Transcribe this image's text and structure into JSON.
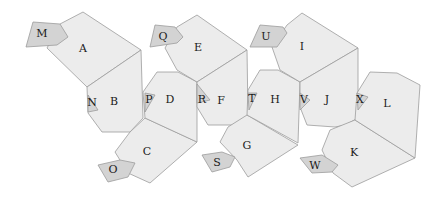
{
  "diagram": {
    "title": "",
    "colors": {
      "face": "#ececec",
      "flap": "#d3d3d3",
      "stroke": "#9c9c9c",
      "label": "#1a1a1a"
    },
    "faces": [
      {
        "label": "A",
        "type": "face",
        "pos": [
          83,
          49
        ],
        "points": [
          [
            60,
            24
          ],
          [
            83,
            12
          ],
          [
            141,
            50
          ],
          [
            87,
            87
          ],
          [
            47,
            48
          ]
        ]
      },
      {
        "label": "M",
        "type": "flap",
        "pos": [
          42,
          34
        ],
        "points": [
          [
            33,
            22
          ],
          [
            60,
            24
          ],
          [
            68,
            37
          ],
          [
            57,
            45
          ],
          [
            26,
            47
          ]
        ]
      },
      {
        "label": "B",
        "type": "face",
        "pos": [
          114,
          102
        ],
        "points": [
          [
            87,
            87
          ],
          [
            141,
            50
          ],
          [
            143,
            118
          ],
          [
            130,
            132
          ],
          [
            102,
            132
          ],
          [
            88,
            113
          ]
        ]
      },
      {
        "label": "N",
        "type": "flap",
        "pos": [
          92,
          103
        ],
        "points": [
          [
            88,
            95
          ],
          [
            98,
            110
          ],
          [
            88,
            112
          ]
        ]
      },
      {
        "label": "C",
        "type": "face",
        "pos": [
          147,
          152
        ],
        "points": [
          [
            145,
            118
          ],
          [
            197,
            142
          ],
          [
            150,
            183
          ],
          [
            128,
            173
          ],
          [
            115,
            152
          ],
          [
            130,
            132
          ]
        ]
      },
      {
        "label": "O",
        "type": "flap",
        "pos": [
          113,
          170
        ],
        "points": [
          [
            98,
            165
          ],
          [
            120,
            160
          ],
          [
            135,
            163
          ],
          [
            128,
            177
          ],
          [
            108,
            182
          ]
        ]
      },
      {
        "label": "D",
        "type": "face",
        "pos": [
          170,
          100
        ],
        "points": [
          [
            143,
            92
          ],
          [
            157,
            72
          ],
          [
            178,
            72
          ],
          [
            197,
            82
          ],
          [
            197,
            142
          ],
          [
            145,
            118
          ]
        ]
      },
      {
        "label": "P",
        "type": "flap",
        "pos": [
          149,
          100
        ],
        "points": [
          [
            145,
            93
          ],
          [
            155,
            95
          ],
          [
            145,
            112
          ]
        ]
      },
      {
        "label": "E",
        "type": "face",
        "pos": [
          198,
          48
        ],
        "points": [
          [
            177,
            27
          ],
          [
            197,
            15
          ],
          [
            247,
            50
          ],
          [
            197,
            82
          ],
          [
            177,
            70
          ],
          [
            165,
            48
          ]
        ]
      },
      {
        "label": "Q",
        "type": "flap",
        "pos": [
          163,
          37
        ],
        "points": [
          [
            155,
            25
          ],
          [
            175,
            27
          ],
          [
            183,
            37
          ],
          [
            177,
            43
          ],
          [
            150,
            47
          ]
        ]
      },
      {
        "label": "F",
        "type": "face",
        "pos": [
          221,
          101
        ],
        "points": [
          [
            197,
            82
          ],
          [
            247,
            50
          ],
          [
            248,
            115
          ],
          [
            233,
            125
          ],
          [
            208,
            125
          ],
          [
            197,
            107
          ]
        ]
      },
      {
        "label": "R",
        "type": "flap",
        "pos": [
          202,
          100
        ],
        "points": [
          [
            197,
            84
          ],
          [
            210,
            100
          ],
          [
            197,
            103
          ]
        ]
      },
      {
        "label": "G",
        "type": "face",
        "pos": [
          247,
          146
        ],
        "points": [
          [
            247,
            115
          ],
          [
            298,
            145
          ],
          [
            248,
            177
          ],
          [
            237,
            160
          ],
          [
            220,
            142
          ],
          [
            228,
            127
          ]
        ]
      },
      {
        "label": "S",
        "type": "flap",
        "pos": [
          217,
          163
        ],
        "points": [
          [
            202,
            155
          ],
          [
            222,
            152
          ],
          [
            235,
            157
          ],
          [
            230,
            167
          ],
          [
            212,
            172
          ]
        ]
      },
      {
        "label": "H",
        "type": "face",
        "pos": [
          275,
          100
        ],
        "points": [
          [
            248,
            90
          ],
          [
            260,
            70
          ],
          [
            278,
            70
          ],
          [
            300,
            82
          ],
          [
            298,
            143
          ],
          [
            247,
            115
          ]
        ]
      },
      {
        "label": "T",
        "type": "flap",
        "pos": [
          252,
          99
        ],
        "points": [
          [
            248,
            93
          ],
          [
            257,
            93
          ],
          [
            249,
            110
          ]
        ]
      },
      {
        "label": "I",
        "type": "face",
        "pos": [
          302,
          47
        ],
        "points": [
          [
            287,
            25
          ],
          [
            302,
            13
          ],
          [
            358,
            48
          ],
          [
            300,
            82
          ],
          [
            280,
            70
          ],
          [
            272,
            47
          ]
        ]
      },
      {
        "label": "U",
        "type": "flap",
        "pos": [
          266,
          37
        ],
        "points": [
          [
            260,
            25
          ],
          [
            283,
            27
          ],
          [
            287,
            33
          ],
          [
            277,
            47
          ],
          [
            250,
            47
          ]
        ]
      },
      {
        "label": "J",
        "type": "face",
        "pos": [
          327,
          100
        ],
        "points": [
          [
            300,
            82
          ],
          [
            358,
            48
          ],
          [
            358,
            118
          ],
          [
            345,
            125
          ],
          [
            335,
            127
          ],
          [
            307,
            125
          ],
          [
            300,
            107
          ]
        ]
      },
      {
        "label": "V",
        "type": "flap",
        "pos": [
          304,
          100
        ],
        "points": [
          [
            300,
            93
          ],
          [
            310,
            100
          ],
          [
            300,
            110
          ]
        ]
      },
      {
        "label": "K",
        "type": "face",
        "pos": [
          354,
          153
        ],
        "points": [
          [
            355,
            120
          ],
          [
            415,
            158
          ],
          [
            352,
            187
          ],
          [
            333,
            173
          ],
          [
            322,
            150
          ],
          [
            330,
            130
          ]
        ]
      },
      {
        "label": "W",
        "type": "flap",
        "pos": [
          315,
          166
        ],
        "points": [
          [
            300,
            158
          ],
          [
            322,
            155
          ],
          [
            338,
            165
          ],
          [
            332,
            172
          ],
          [
            312,
            173
          ]
        ]
      },
      {
        "label": "L",
        "type": "face",
        "pos": [
          387,
          104
        ],
        "points": [
          [
            357,
            93
          ],
          [
            370,
            72
          ],
          [
            397,
            73
          ],
          [
            420,
            85
          ],
          [
            415,
            158
          ],
          [
            355,
            120
          ]
        ]
      },
      {
        "label": "X",
        "type": "flap",
        "pos": [
          360,
          100
        ],
        "points": [
          [
            357,
            93
          ],
          [
            368,
            97
          ],
          [
            358,
            110
          ]
        ]
      }
    ]
  }
}
